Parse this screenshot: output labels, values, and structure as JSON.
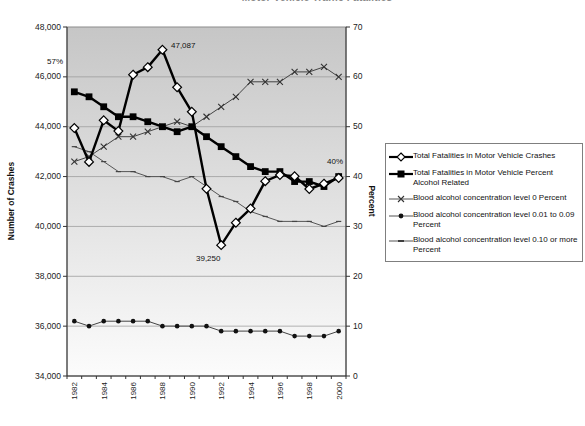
{
  "header": {
    "clipped_title": "Motor Vehicle Traffic Fatalities"
  },
  "chart_data": {
    "type": "line",
    "x": [
      1982,
      1983,
      1984,
      1985,
      1986,
      1987,
      1988,
      1989,
      1990,
      1991,
      1992,
      1993,
      1994,
      1995,
      1996,
      1997,
      1998,
      1999,
      2000
    ],
    "axes": {
      "left": {
        "label": "Number of Crashes",
        "min": 34000,
        "max": 48000,
        "step": 2000,
        "tick_labels": [
          "48,000",
          "46,000",
          "44,000",
          "42,000",
          "40,000",
          "38,000",
          "36,000",
          "34,000"
        ]
      },
      "right": {
        "label": "Percent",
        "min": 0,
        "max": 70,
        "step": 10,
        "tick_labels": [
          "70",
          "60",
          "50",
          "40",
          "30",
          "20",
          "10",
          "0"
        ]
      }
    },
    "grid": "horizontal",
    "legend_position": "right",
    "series": [
      {
        "name": "Total Fatalities in Motor Vehicle Crashes",
        "axis": "left",
        "marker": "diamond",
        "line": "thick",
        "color": "#000000",
        "values": [
          43945,
          42589,
          44257,
          43825,
          46087,
          46390,
          47087,
          45582,
          44599,
          41508,
          39250,
          40150,
          40716,
          41817,
          42065,
          42013,
          41501,
          41717,
          41945
        ]
      },
      {
        "name": "Total Fatalities in Motor Vehicle Percent Alcohol Related",
        "axis": "right",
        "marker": "square",
        "line": "thick",
        "color": "#000000",
        "values": [
          57,
          56,
          54,
          52,
          52,
          51,
          50,
          49,
          50,
          48,
          46,
          44,
          42,
          41,
          41,
          39,
          39,
          38,
          40
        ]
      },
      {
        "name": "Blood alcohol concentration level 0 Percent",
        "axis": "right",
        "marker": "x",
        "line": "thin",
        "color": "#444444",
        "values": [
          43,
          44,
          46,
          48,
          48,
          49,
          50,
          51,
          50,
          52,
          54,
          56,
          59,
          59,
          59,
          61,
          61,
          62,
          60
        ]
      },
      {
        "name": "Blood alcohol concentration level 0.01 to 0.09 Percent",
        "axis": "right",
        "marker": "circle",
        "line": "thin",
        "color": "#444444",
        "values": [
          11,
          10,
          11,
          11,
          11,
          11,
          10,
          10,
          10,
          10,
          9,
          9,
          9,
          9,
          9,
          8,
          8,
          8,
          9
        ]
      },
      {
        "name": "Blood alcohol concentration level 0.10 or more Percent",
        "axis": "right",
        "marker": "dash",
        "line": "thin",
        "color": "#555555",
        "values": [
          46,
          45,
          43,
          41,
          41,
          40,
          40,
          39,
          40,
          38,
          36,
          35,
          33,
          32,
          31,
          31,
          31,
          30,
          31
        ]
      }
    ],
    "annotations": [
      {
        "text": "57%",
        "x": 47,
        "y": 64,
        "anchor": "start"
      },
      {
        "text": "47,087",
        "x": 171,
        "y": 48,
        "anchor": "start"
      },
      {
        "text": "39,250",
        "x": 196,
        "y": 261,
        "anchor": "start"
      },
      {
        "text": "40%",
        "x": 327,
        "y": 164,
        "anchor": "start"
      }
    ],
    "plot_bg": {
      "top": "#c6c6c6",
      "bottom": "#fcfcfc"
    },
    "gridline_color": "#9e9e9e",
    "axis_color": "#333333",
    "tick_label_color": "#222222"
  },
  "legend": {
    "items": [
      {
        "label": "Total Fatalities in Motor Vehicle Crashes",
        "marker": "diamond"
      },
      {
        "label": "Total Fatalities in Motor Vehicle Percent Alcohol Related",
        "marker": "square"
      },
      {
        "label": "Blood alcohol concentration level 0 Percent",
        "marker": "x"
      },
      {
        "label": "Blood alcohol concentration level 0.01 to 0.09 Percent",
        "marker": "circle"
      },
      {
        "label": "Blood alcohol concentration level 0.10 or more Percent",
        "marker": "dash"
      }
    ]
  }
}
